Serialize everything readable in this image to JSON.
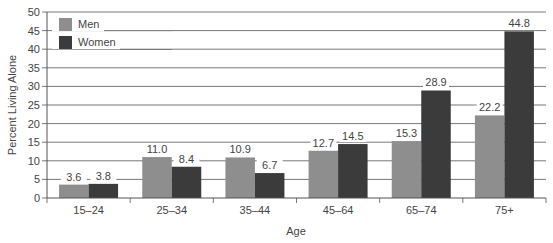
{
  "chart_data": {
    "type": "bar",
    "title": "",
    "xlabel": "Age",
    "ylabel": "Percent Living Alone",
    "ylim": [
      0,
      50
    ],
    "yticks": [
      0,
      5,
      10,
      15,
      20,
      25,
      30,
      35,
      40,
      45,
      50
    ],
    "grid": true,
    "legend_position": "upper-left",
    "categories": [
      "15–24",
      "25–34",
      "35–44",
      "45–64",
      "65–74",
      "75+"
    ],
    "series": [
      {
        "name": "Men",
        "color": "#8e8e8e",
        "values": [
          3.6,
          11.0,
          10.9,
          12.7,
          15.3,
          22.2
        ]
      },
      {
        "name": "Women",
        "color": "#3b3b3b",
        "values": [
          3.8,
          8.4,
          6.7,
          14.5,
          28.9,
          44.8
        ]
      }
    ]
  }
}
